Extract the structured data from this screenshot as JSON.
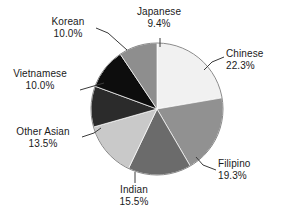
{
  "chart_data": {
    "type": "pie",
    "title": "",
    "subtitle": "",
    "xlabel": "",
    "ylabel": "",
    "grid": false,
    "legend_position": "none",
    "labels_outside": true,
    "leader_lines": true,
    "value_suffix": "%",
    "start_angle_deg": 0,
    "direction": "clockwise",
    "categories": [
      "Chinese",
      "Filipino",
      "Indian",
      "Other Asian",
      "Vietnamese",
      "Korean",
      "Japanese"
    ],
    "values": [
      22.3,
      19.3,
      15.5,
      13.5,
      10.0,
      10.0,
      9.4
    ],
    "colors": [
      "#f1f1f1",
      "#919191",
      "#6b6b6b",
      "#c9c9c9",
      "#2b2b2b",
      "#0d0d0d",
      "#8e8e8e"
    ],
    "slices": [
      {
        "label": "Chinese",
        "value": 22.3,
        "value_text": "22.3%",
        "color": "#f1f1f1"
      },
      {
        "label": "Filipino",
        "value": 19.3,
        "value_text": "19.3%",
        "color": "#919191"
      },
      {
        "label": "Indian",
        "value": 15.5,
        "value_text": "15.5%",
        "color": "#6b6b6b"
      },
      {
        "label": "Other Asian",
        "value": 13.5,
        "value_text": "13.5%",
        "color": "#c9c9c9"
      },
      {
        "label": "Vietnamese",
        "value": 10.0,
        "value_text": "10.0%",
        "color": "#2b2b2b"
      },
      {
        "label": "Korean",
        "value": 10.0,
        "value_text": "10.0%",
        "color": "#0d0d0d"
      },
      {
        "label": "Japanese",
        "value": 9.4,
        "value_text": "9.4%",
        "color": "#8e8e8e"
      }
    ]
  },
  "figure": {
    "background": "#ffffff",
    "outline_color": "#8a8a8a",
    "leader_color": "#3a3a3a",
    "text_color": "#1a1a1a"
  }
}
